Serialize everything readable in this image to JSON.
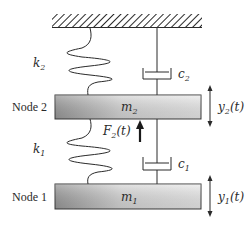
{
  "diagram": {
    "ground": {
      "label": ""
    },
    "nodes": [
      {
        "id": "node2",
        "label": "Node 2",
        "mass_label": "m",
        "mass_sub": "2",
        "disp_label": "y",
        "disp_sub": "2",
        "disp_arg": "(t)"
      },
      {
        "id": "node1",
        "label": "Node 1",
        "mass_label": "m",
        "mass_sub": "1",
        "disp_label": "y",
        "disp_sub": "1",
        "disp_arg": "(t)"
      }
    ],
    "springs": [
      {
        "id": "k2",
        "label": "k",
        "sub": "2"
      },
      {
        "id": "k1",
        "label": "k",
        "sub": "1"
      }
    ],
    "dampers": [
      {
        "id": "c2",
        "label": "c",
        "sub": "2"
      },
      {
        "id": "c1",
        "label": "c",
        "sub": "1"
      }
    ],
    "force": {
      "label": "F",
      "sub": "2",
      "arg": "(t)"
    },
    "colors": {
      "line": "#2a2a2a",
      "mass_light": "#ececec",
      "mass_dark": "#9a9a9a"
    }
  }
}
